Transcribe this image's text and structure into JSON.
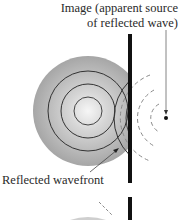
{
  "labels": {
    "image_line1": "Image (apparent source",
    "image_line2": "of reflected wave)",
    "reflected_wavefront": "Reflected wavefront"
  },
  "colors": {
    "wave_fill_outer": "#a9a9a9",
    "wave_fill_center": "#f4f4f4",
    "ring_stroke": "#333333",
    "barrier": "#111111",
    "dashed_arc": "#8a8a8a",
    "arrow": "#555555",
    "text": "#2a2a2a"
  },
  "geometry": {
    "source_center": [
      88,
      111
    ],
    "ring_radii": [
      55,
      40,
      27,
      14
    ],
    "barrier_x": 130,
    "image_point": [
      166,
      118
    ]
  }
}
